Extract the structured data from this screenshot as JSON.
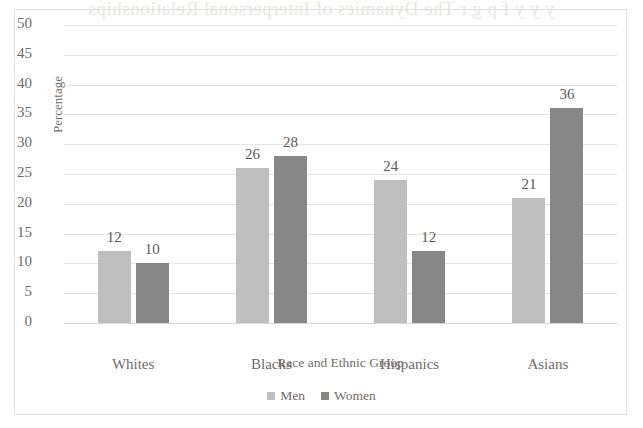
{
  "page": {
    "bleed_through_text": "y y  y   f  p    g  r  The Dynamics of Interpersonal Relationships"
  },
  "chart_data": {
    "type": "bar",
    "title": "",
    "subtitle": "",
    "xlabel": "Race and Ethnic Group",
    "ylabel": "Percentage",
    "categories": [
      "Whites",
      "Blacks",
      "Hispanics",
      "Asians"
    ],
    "series": [
      {
        "name": "Men",
        "color": "#bfbfbf",
        "values": [
          12,
          26,
          24,
          21
        ]
      },
      {
        "name": "Women",
        "color": "#878787",
        "values": [
          10,
          28,
          12,
          36
        ]
      }
    ],
    "ylim": [
      0,
      50
    ],
    "y_ticks": [
      50,
      45,
      40,
      35,
      30,
      25,
      20,
      15,
      10,
      5,
      0
    ],
    "grid": true,
    "legend_position": "bottom",
    "data_labels": true
  }
}
